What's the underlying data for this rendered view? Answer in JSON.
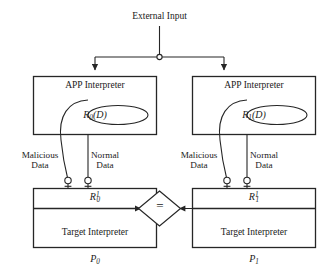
{
  "figure": {
    "external_input_label": "External Input",
    "junction_icon": "junction-dot-icon",
    "comparator_symbol": "=",
    "stroke_color": "#262626",
    "background_color": "#ffffff"
  },
  "left_process": {
    "name_label": "P",
    "name_sub": "0",
    "app_interpreter_label": "APP Interpreter",
    "rewrite_oval_label": "R",
    "rewrite_oval_sub": "0",
    "rewrite_oval_arg": "(D)",
    "result_label": "R",
    "result_sub": "0",
    "result_sup": "1",
    "target_interpreter_label": "Target Interpreter",
    "malicious_label_line1": "Malicious",
    "malicious_label_line2": "Data",
    "normal_label_line1": "Normal",
    "normal_label_line2": "Data",
    "malicious_port_icon": "lollipop-port-icon",
    "normal_port_icon": "lollipop-port-icon"
  },
  "right_process": {
    "name_label": "P",
    "name_sub": "1",
    "app_interpreter_label": "APP Interpreter",
    "rewrite_oval_label": "R",
    "rewrite_oval_sub": "1",
    "rewrite_oval_arg": "(D)",
    "result_label": "R",
    "result_sub": "1",
    "result_sup": "1",
    "target_interpreter_label": "Target Interpreter",
    "malicious_label_line1": "Malicious",
    "malicious_label_line2": "Data",
    "normal_label_line1": "Normal",
    "normal_label_line2": "Data",
    "malicious_port_icon": "lollipop-port-icon",
    "normal_port_icon": "lollipop-port-icon"
  }
}
